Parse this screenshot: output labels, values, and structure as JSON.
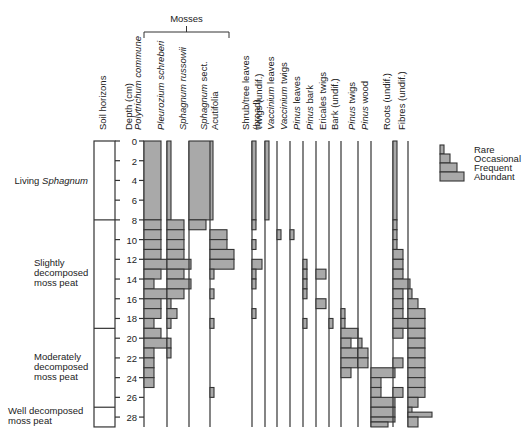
{
  "group_label": "Mosses",
  "headers": {
    "soil": "Soil horizons",
    "depth": "Depth (cm)"
  },
  "depth_ticks": [
    0,
    2,
    4,
    6,
    8,
    10,
    12,
    14,
    16,
    18,
    20,
    22,
    24,
    26,
    28
  ],
  "soil_horizons": [
    {
      "label": "Living",
      "label_italic": "Sphagnum",
      "from": 0,
      "to": 8
    },
    {
      "label": "Slightly decomposed moss peat",
      "from": 8,
      "to": 19
    },
    {
      "label": "Moderately decomposed moss peat",
      "from": 19,
      "to": 27
    },
    {
      "label": "Well decomposed moss peat",
      "from": 27,
      "to": 29
    }
  ],
  "legend": {
    "items": [
      "Rare",
      "Occasional",
      "Frequent",
      "Abundant"
    ]
  },
  "chart_data": {
    "type": "stratigraphic-abundance",
    "title": "",
    "ylabel": "Depth (cm)",
    "ylim": [
      0,
      29
    ],
    "abundance_scale": {
      "1": "Rare",
      "2": "Occasional",
      "3": "Frequent",
      "4": "Abundant"
    },
    "series": [
      {
        "name": "Polytrichum commune",
        "italic": true,
        "group": "Mosses",
        "x": 144,
        "intervals": [
          [
            0,
            8,
            3
          ],
          [
            8,
            9,
            3
          ],
          [
            9,
            10,
            3
          ],
          [
            10,
            11,
            3
          ],
          [
            11,
            12,
            3
          ],
          [
            12,
            13,
            4
          ],
          [
            13,
            14,
            3
          ],
          [
            14,
            15,
            2
          ],
          [
            15,
            16,
            4
          ],
          [
            16,
            17,
            3
          ],
          [
            17,
            18,
            3
          ],
          [
            18,
            19,
            2
          ],
          [
            19,
            20,
            3
          ],
          [
            20,
            21,
            4
          ],
          [
            21,
            22,
            2
          ],
          [
            22,
            23,
            2
          ],
          [
            23,
            24,
            2
          ],
          [
            24,
            25,
            2
          ]
        ]
      },
      {
        "name": "Pleurozium schreberi",
        "italic": true,
        "group": "Mosses",
        "x": 167,
        "intervals": [
          [
            0,
            8,
            1
          ],
          [
            8,
            9,
            3
          ],
          [
            9,
            10,
            3
          ],
          [
            10,
            11,
            3
          ],
          [
            11,
            12,
            3
          ],
          [
            12,
            13,
            4
          ],
          [
            13,
            14,
            3
          ],
          [
            14,
            15,
            4
          ],
          [
            15,
            16,
            3
          ],
          [
            16,
            17,
            1
          ],
          [
            17,
            18,
            2
          ],
          [
            18,
            19,
            1
          ],
          [
            20,
            21,
            1
          ],
          [
            21,
            22,
            1
          ]
        ]
      },
      {
        "name": "Sphagnum russowii",
        "italic": true,
        "group": "Mosses",
        "x": 189,
        "intervals": [
          [
            0,
            8,
            4
          ],
          [
            8,
            9,
            3
          ]
        ]
      },
      {
        "name": "Sphagnum sect. Acutifolia",
        "italic_part": "Sphagnum",
        "group": "Mosses",
        "x": 210,
        "intervals": [
          [
            9,
            10,
            3
          ],
          [
            10,
            11,
            3
          ],
          [
            11,
            12,
            4
          ],
          [
            12,
            13,
            4
          ],
          [
            13,
            14,
            1
          ],
          [
            15,
            16,
            1
          ],
          [
            18,
            19,
            1
          ],
          [
            25,
            26,
            1
          ]
        ]
      },
      {
        "name": "Shrub/tree leaves (broad)",
        "x": 252,
        "intervals": [
          [
            0,
            8,
            1
          ],
          [
            8,
            9,
            1
          ],
          [
            10,
            11,
            1
          ],
          [
            12,
            13,
            2
          ],
          [
            13,
            14,
            1
          ],
          [
            14,
            15,
            1
          ],
          [
            17,
            18,
            1
          ]
        ]
      },
      {
        "name": "Twigs (undif.)",
        "x": 265,
        "intervals": [
          [
            0,
            8,
            1
          ]
        ]
      },
      {
        "name": "Vaccinium leaves",
        "italic_part": "Vaccinium",
        "x": 277,
        "intervals": [
          [
            9,
            10,
            1
          ]
        ]
      },
      {
        "name": "Vaccinium twigs",
        "italic_part": "Vaccinium",
        "x": 290,
        "intervals": [
          [
            9,
            10,
            1
          ]
        ]
      },
      {
        "name": "Pinus leaves",
        "italic_part": "Pinus",
        "x": 303,
        "intervals": [
          [
            12,
            13,
            1
          ],
          [
            13,
            14,
            1
          ],
          [
            14,
            15,
            1
          ],
          [
            15,
            16,
            1
          ],
          [
            18,
            19,
            1
          ]
        ]
      },
      {
        "name": "Pinus bark",
        "italic_part": "Pinus",
        "x": 316,
        "intervals": [
          [
            13,
            14,
            2
          ],
          [
            16,
            17,
            2
          ]
        ]
      },
      {
        "name": "Ericales twigs",
        "x": 329,
        "intervals": [
          [
            18,
            19,
            1
          ]
        ]
      },
      {
        "name": "Bark (undif.)",
        "x": 341,
        "intervals": [
          [
            17,
            18,
            1
          ],
          [
            18,
            19,
            1
          ],
          [
            19,
            20,
            3
          ],
          [
            20,
            21,
            2
          ],
          [
            21,
            22,
            3
          ],
          [
            22,
            23,
            3
          ],
          [
            23,
            24,
            2
          ]
        ]
      },
      {
        "name": "Pinus twigs",
        "italic_part": "Pinus",
        "x": 358,
        "intervals": [
          [
            20,
            21,
            1
          ],
          [
            21,
            22,
            2
          ],
          [
            22,
            23,
            2
          ]
        ]
      },
      {
        "name": "Pinus wood",
        "italic_part": "Pinus",
        "x": 371,
        "intervals": [
          [
            23,
            24,
            4
          ],
          [
            24,
            25,
            2
          ],
          [
            25,
            26,
            2
          ],
          [
            26,
            27,
            4
          ],
          [
            27,
            28,
            4
          ],
          [
            28,
            28.5,
            4
          ],
          [
            28.5,
            29,
            3
          ]
        ]
      },
      {
        "name": "Roots (undif.)",
        "x": 393,
        "intervals": [
          [
            0,
            8,
            1
          ],
          [
            8,
            9,
            1
          ],
          [
            9,
            10,
            1
          ],
          [
            10,
            11,
            1
          ],
          [
            11,
            12,
            2
          ],
          [
            12,
            13,
            2
          ],
          [
            13,
            14,
            2
          ],
          [
            14,
            15,
            3
          ],
          [
            15,
            16,
            2
          ],
          [
            16,
            17,
            2
          ],
          [
            17,
            18,
            2
          ],
          [
            18,
            19,
            3
          ],
          [
            19,
            20,
            2
          ],
          [
            22,
            23,
            2
          ],
          [
            25,
            26,
            2
          ]
        ]
      },
      {
        "name": "Fibres (undif.)",
        "x": 408,
        "intervals": [
          [
            15,
            16,
            1
          ],
          [
            16,
            17,
            2
          ],
          [
            17,
            18,
            3
          ],
          [
            18,
            19,
            3
          ],
          [
            19,
            20,
            3
          ],
          [
            20,
            21,
            3
          ],
          [
            21,
            22,
            3
          ],
          [
            22,
            23,
            3
          ],
          [
            23,
            24,
            3
          ],
          [
            24,
            25,
            3
          ],
          [
            25,
            26,
            3
          ],
          [
            26,
            27,
            2
          ],
          [
            27,
            28,
            1
          ],
          [
            27.5,
            28,
            4
          ],
          [
            28,
            29,
            2
          ]
        ]
      }
    ]
  }
}
